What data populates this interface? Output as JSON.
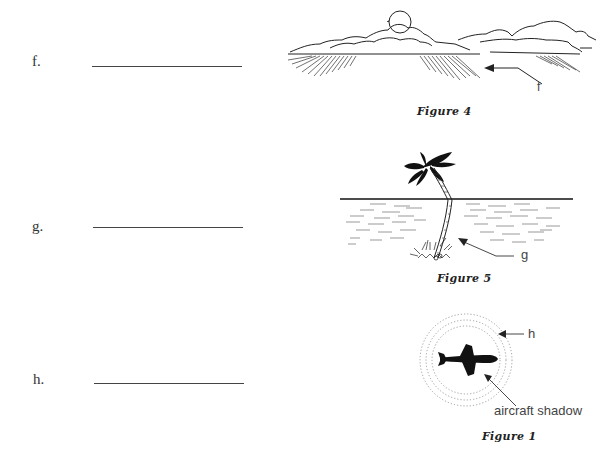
{
  "questions": [
    {
      "label": "f.",
      "answer": ""
    },
    {
      "label": "g.",
      "answer": ""
    },
    {
      "label": "h.",
      "answer": ""
    }
  ],
  "figures": [
    {
      "caption": "Figure 4",
      "callout": "f",
      "subject": "clouds-with-shadow-streaks"
    },
    {
      "caption": "Figure 5",
      "callout": "g",
      "subject": "palm-tree-reflection-on-water"
    },
    {
      "caption": "Figure 1",
      "callout": "h",
      "extra_label": "aircraft shadow",
      "subject": "aircraft-shadow-halo"
    }
  ]
}
